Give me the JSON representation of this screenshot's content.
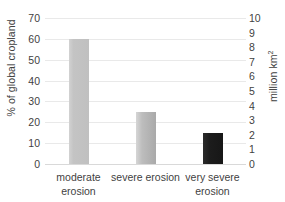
{
  "chart_data": {
    "type": "bar",
    "title": "",
    "subtitle": "",
    "categories": [
      "moderate erosion",
      "severe erosion",
      "very severe erosion"
    ],
    "category_lines": [
      [
        "moderate",
        "erosion"
      ],
      [
        "severe erosion",
        ""
      ],
      [
        "very severe",
        "erosion"
      ]
    ],
    "series": [
      {
        "name": "% of global cropland",
        "values": [
          60,
          25,
          15
        ],
        "colors": [
          "#c4c4c4",
          "#b4b4b4",
          "#1c1c1c"
        ]
      }
    ],
    "ylabel": "% of global cropland",
    "ylabel_secondary_text": "million km",
    "ylabel_secondary_sup": "2",
    "xlabel": "",
    "ylim": [
      0,
      70
    ],
    "yticks": [
      70,
      60,
      50,
      40,
      30,
      20,
      10,
      0
    ],
    "ylim_secondary": [
      0,
      10
    ],
    "yticks_secondary": [
      10,
      9,
      8,
      7,
      6,
      5,
      4,
      3,
      2,
      1,
      0
    ],
    "secondary_values": [
      8.6,
      3.6,
      2.1
    ],
    "grid": true,
    "grid_color": "#e9e9e9",
    "legend": "none",
    "background": "#ffffff"
  }
}
